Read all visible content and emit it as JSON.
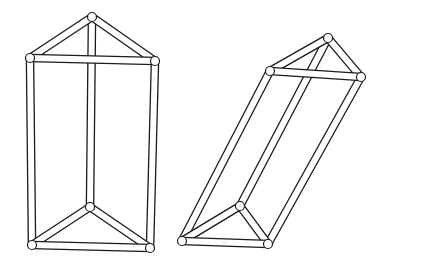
{
  "figure": {
    "ink_color": "#1a1a1a",
    "background_color": "#ffffff",
    "tube_width": 6,
    "tube_stroke": 1.3
  },
  "prisms": [
    {
      "name": "upright-prism",
      "top": {
        "apex": [
          92,
          17
        ],
        "left": [
          30,
          58
        ],
        "right": [
          155,
          61
        ]
      },
      "bottom": {
        "apex": [
          90,
          207
        ],
        "left": [
          32,
          245
        ],
        "right": [
          150,
          248
        ]
      }
    },
    {
      "name": "tilted-prism",
      "top": {
        "apex": [
          328,
          38
        ],
        "left": [
          270,
          71
        ],
        "right": [
          361,
          77
        ]
      },
      "bottom": {
        "apex": [
          240,
          206
        ],
        "left": [
          182,
          241
        ],
        "right": [
          268,
          244
        ]
      }
    }
  ]
}
